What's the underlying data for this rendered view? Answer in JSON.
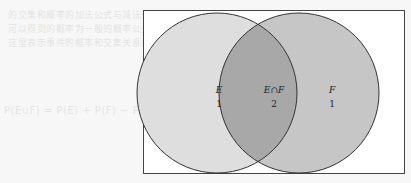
{
  "diagram": {
    "type": "venn",
    "sets": [
      {
        "name": "E",
        "label": "E",
        "count_label": "1",
        "fill": "#dedede"
      },
      {
        "name": "F",
        "label": "F",
        "count_label": "1",
        "fill": "#c6c6c6"
      }
    ],
    "intersection": {
      "label": "E∩F",
      "count_label": "2",
      "fill": "#a8a8a8"
    },
    "frame_stroke": "#444444",
    "circle_stroke": "#333333"
  },
  "bleed_through": {
    "line1": "的交集和概率的加法公式与减法公式的概率计算方法",
    "line2": "可以得到的概率为一般的概率公式的推导过程",
    "line3": "这里表示事件的概率和交集关系的结果",
    "line4": "P(E∪F) = P(E) + P(F) − P(E∩F)"
  }
}
